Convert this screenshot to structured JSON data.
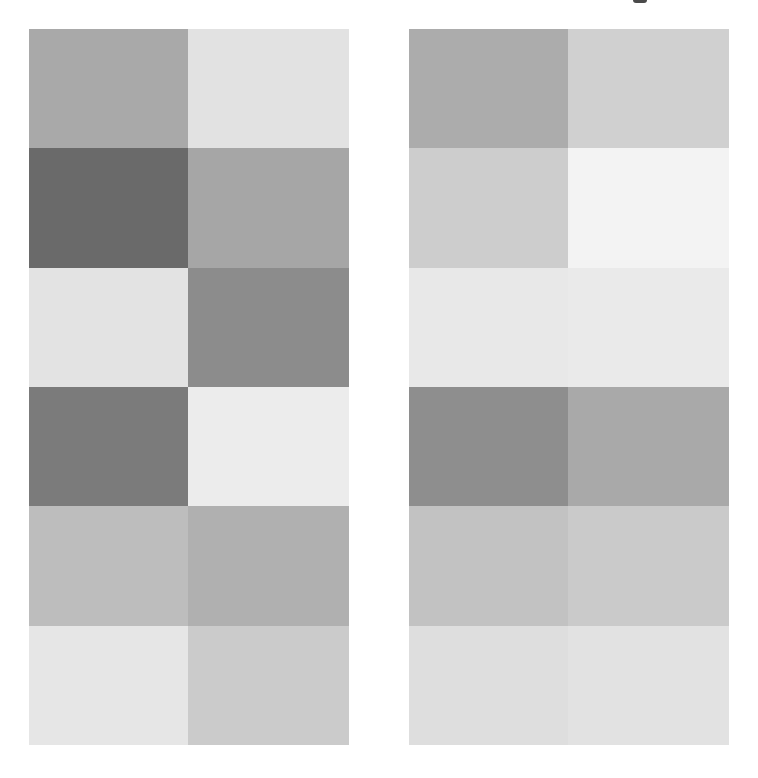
{
  "canvas": {
    "width": 758,
    "height": 778,
    "background": "#ffffff"
  },
  "top_mark": {
    "color": "#4a4a4a",
    "x": 633,
    "y": 0
  },
  "panels": [
    {
      "id": "left",
      "x": 29,
      "y": 29,
      "width": 320,
      "height": 716,
      "rows": [
        {
          "cells": [
            "#a9a9a9",
            "#e2e2e2"
          ]
        },
        {
          "cells": [
            "#6a6a6a",
            "#a6a6a6"
          ]
        },
        {
          "cells": [
            "#e3e3e3",
            "#8c8c8c"
          ]
        },
        {
          "cells": [
            "#7b7b7b",
            "#ececec"
          ]
        },
        {
          "cells": [
            "#bdbdbd",
            "#b0b0b0"
          ]
        },
        {
          "cells": [
            "#e6e6e6",
            "#cbcbcb"
          ]
        }
      ]
    },
    {
      "id": "right",
      "x": 409,
      "y": 29,
      "width": 320,
      "height": 716,
      "rows": [
        {
          "cells": [
            "#acacac",
            "#d0d0d0"
          ]
        },
        {
          "cells": [
            "#cdcdcd",
            "#f3f3f3"
          ]
        },
        {
          "cells": [
            "#e8e8e8",
            "#eaeaea"
          ]
        },
        {
          "cells": [
            "#8e8e8e",
            "#a9a9a9"
          ]
        },
        {
          "cells": [
            "#c2c2c2",
            "#cacaca"
          ]
        },
        {
          "cells": [
            "#dedede",
            "#e2e2e2"
          ]
        }
      ]
    }
  ]
}
